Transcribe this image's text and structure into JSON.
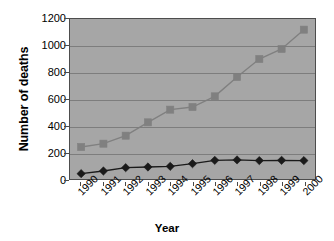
{
  "chart_data": {
    "type": "line",
    "title": "",
    "xlabel": "Year",
    "ylabel": "Number of deaths",
    "categories": [
      "1990",
      "1991",
      "1992",
      "1993",
      "1994",
      "1995",
      "1996",
      "1997",
      "1998",
      "1999",
      "2000"
    ],
    "yticks": [
      0,
      200,
      400,
      600,
      800,
      1000,
      1200
    ],
    "ylim": [
      0,
      1200
    ],
    "grid": true,
    "legend": "none",
    "plot_background": "#a6a6a6",
    "series": [
      {
        "name": "upper-series",
        "marker": "square",
        "color": "#808080",
        "values": [
          240,
          265,
          325,
          425,
          520,
          540,
          620,
          765,
          900,
          975,
          1120
        ]
      },
      {
        "name": "lower-series",
        "marker": "diamond",
        "color": "#1a1a1a",
        "values": [
          40,
          60,
          85,
          90,
          95,
          115,
          140,
          143,
          138,
          140,
          138
        ]
      }
    ]
  }
}
